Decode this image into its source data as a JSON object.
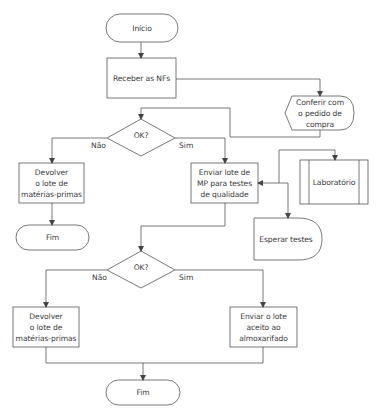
{
  "diagram": {
    "type": "flowchart",
    "stroke_color": "#555555",
    "text_color": "#3a3a3a",
    "nodes": {
      "start": {
        "shape": "terminal",
        "label": "Início"
      },
      "receive_invoices": {
        "shape": "process",
        "label": "Receber as NFs"
      },
      "check_order": {
        "shape": "display",
        "label": "Conferir com\no pedido de\ncompra"
      },
      "decision1": {
        "shape": "decision",
        "label": "OK?"
      },
      "return_lot1": {
        "shape": "process",
        "label": "Devolver\no lote de\nmatérias-primas"
      },
      "end1": {
        "shape": "terminal",
        "label": "Fim"
      },
      "send_lot_tests": {
        "shape": "process",
        "label": "Enviar lote de\nMP para testes\nde qualidade"
      },
      "laboratory": {
        "shape": "predefined-process",
        "label": "Laboratório"
      },
      "wait_tests": {
        "shape": "delay",
        "label": "Esperar testes"
      },
      "decision2": {
        "shape": "decision",
        "label": "OK?"
      },
      "return_lot2": {
        "shape": "process",
        "label": "Devolver\no lote de\nmatérias-primas"
      },
      "send_warehouse": {
        "shape": "process",
        "label": "Enviar o lote\naceito ao\nalmoxarifado"
      },
      "end2": {
        "shape": "terminal",
        "label": "Fim"
      }
    },
    "branches": {
      "d1_no": "Não",
      "d1_yes": "Sim",
      "d2_no": "Não",
      "d2_yes": "Sim"
    }
  }
}
